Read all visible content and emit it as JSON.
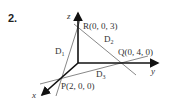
{
  "problem_number": "2.",
  "axes": {
    "x": "x",
    "y": "y",
    "z": "z"
  },
  "points": {
    "P": "P(2, 0, 0)",
    "Q": "Q(0, 4, 0)",
    "R": "R(0, 0, 3)"
  },
  "lines": {
    "D1": "D",
    "D1_sub": "1",
    "D2": "D",
    "D2_sub": "2",
    "D3": "D",
    "D3_sub": "3"
  },
  "colors": {
    "axis": "#111111",
    "line": "#888888",
    "text": "#333333"
  }
}
